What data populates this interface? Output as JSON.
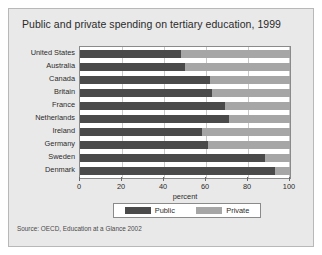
{
  "figure": {
    "title": "Public and private spending on tertiary education, 1999",
    "source": "Source: OECD, Education at a Glance 2002"
  },
  "colors": {
    "public": "#4a4a4a",
    "private": "#a6a6a6",
    "background": "#e9e9e9",
    "plot_background": "#ffffff",
    "grid": "#c9c9c9",
    "axis": "#8a8a8a"
  },
  "chart_data": {
    "type": "bar",
    "orientation": "horizontal",
    "stacked": true,
    "title": "Public and private spending on tertiary education, 1999",
    "xlabel": "percent",
    "ylabel": "",
    "xlim": [
      0,
      100
    ],
    "xticks": [
      0,
      20,
      40,
      60,
      80,
      100
    ],
    "xticklabels": [
      "0",
      "20",
      "40",
      "60",
      "80",
      "100"
    ],
    "grid": true,
    "legend_position": "bottom",
    "categories": [
      "United States",
      "Australia",
      "Canada",
      "Britain",
      "France",
      "Netherlands",
      "Ireland",
      "Germany",
      "Sweden",
      "Denmark"
    ],
    "series": [
      {
        "name": "Public",
        "color": "#4a4a4a",
        "values": [
          48,
          50,
          62,
          63,
          69,
          71,
          58,
          61,
          88,
          93
        ]
      },
      {
        "name": "Private",
        "color": "#a6a6a6",
        "values": [
          52,
          50,
          38,
          37,
          31,
          29,
          42,
          39,
          12,
          7
        ]
      }
    ]
  }
}
